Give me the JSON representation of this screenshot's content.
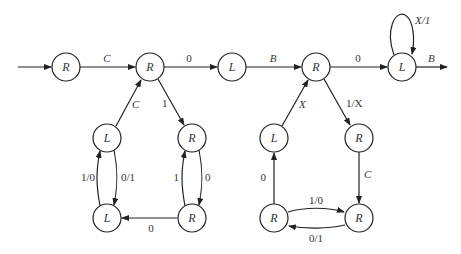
{
  "diagram": {
    "type": "turing-machine-state-diagram",
    "node_radius": 14,
    "nodes": [
      {
        "id": "n1",
        "label": "R",
        "x": 66,
        "y": 67
      },
      {
        "id": "n2",
        "label": "R",
        "x": 150,
        "y": 67
      },
      {
        "id": "n3",
        "label": "L",
        "x": 232,
        "y": 67
      },
      {
        "id": "n4",
        "label": "R",
        "x": 316,
        "y": 67
      },
      {
        "id": "n5",
        "label": "L",
        "x": 402,
        "y": 67
      },
      {
        "id": "n6",
        "label": "L",
        "x": 107,
        "y": 138
      },
      {
        "id": "n7",
        "label": "R",
        "x": 192,
        "y": 138
      },
      {
        "id": "n8",
        "label": "L",
        "x": 107,
        "y": 218
      },
      {
        "id": "n9",
        "label": "R",
        "x": 192,
        "y": 218
      },
      {
        "id": "n10",
        "label": "L",
        "x": 274,
        "y": 138
      },
      {
        "id": "n11",
        "label": "R",
        "x": 359,
        "y": 138
      },
      {
        "id": "n12",
        "label": "R",
        "x": 274,
        "y": 218
      },
      {
        "id": "n13",
        "label": "R",
        "x": 359,
        "y": 218
      }
    ],
    "edges": [
      {
        "from": "start",
        "to": "n1",
        "label": ""
      },
      {
        "from": "n1",
        "to": "n2",
        "label": "C"
      },
      {
        "from": "n2",
        "to": "n3",
        "label": "0"
      },
      {
        "from": "n3",
        "to": "n4",
        "label": "B"
      },
      {
        "from": "n4",
        "to": "n5",
        "label": "0"
      },
      {
        "from": "n5",
        "to": "n5",
        "label": "X/1"
      },
      {
        "from": "n5",
        "to": "exit",
        "label": "B"
      },
      {
        "from": "n6",
        "to": "n2",
        "label": "C"
      },
      {
        "from": "n2",
        "to": "n7",
        "label": "1"
      },
      {
        "from": "n8",
        "to": "n6",
        "label": "1/0"
      },
      {
        "from": "n6",
        "to": "n8",
        "label": "0/1"
      },
      {
        "from": "n9",
        "to": "n7",
        "label": "1"
      },
      {
        "from": "n7",
        "to": "n9",
        "label": "0"
      },
      {
        "from": "n9",
        "to": "n8",
        "label": "0"
      },
      {
        "from": "n10",
        "to": "n4",
        "label": "X"
      },
      {
        "from": "n4",
        "to": "n11",
        "label": "1/X"
      },
      {
        "from": "n12",
        "to": "n10",
        "label": "0"
      },
      {
        "from": "n11",
        "to": "n13",
        "label": "C"
      },
      {
        "from": "n12",
        "to": "n13",
        "label": "1/0"
      },
      {
        "from": "n13",
        "to": "n12",
        "label": "0/1"
      }
    ]
  }
}
